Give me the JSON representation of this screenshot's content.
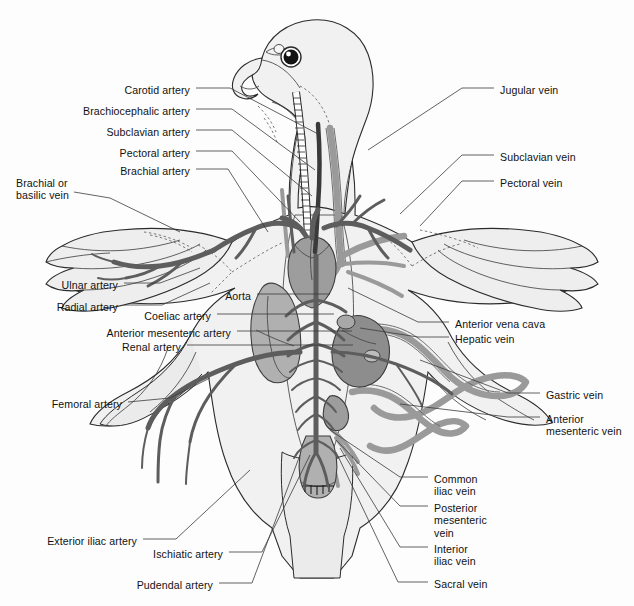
{
  "figure": {
    "colors": {
      "artery": "#5f5f5f",
      "vein": "#8f8f8f",
      "organ_fill": "#9a9a9a",
      "body_fill": "#f0f0f0",
      "outline": "#2b2b2b",
      "leader_line": "#3a3a3a",
      "text": "#111111",
      "background": "#fdfdfd"
    }
  },
  "labels_left": [
    {
      "id": "carotid-artery",
      "text": "Carotid artery",
      "x": 190,
      "y": 84,
      "align": "right"
    },
    {
      "id": "brachiocephalic-artery",
      "text": "Brachiocephalic artery",
      "x": 190,
      "y": 105,
      "align": "right"
    },
    {
      "id": "subclavian-artery",
      "text": "Subclavian artery",
      "x": 190,
      "y": 126,
      "align": "right"
    },
    {
      "id": "pectoral-artery",
      "text": "Pectoral artery",
      "x": 190,
      "y": 147,
      "align": "right"
    },
    {
      "id": "brachial-artery",
      "text": "Brachial artery",
      "x": 190,
      "y": 165,
      "align": "right"
    },
    {
      "id": "brachial-or-basilic-vein",
      "text": "Brachial or\nbasilic vein",
      "x": 16,
      "y": 177,
      "align": "left"
    },
    {
      "id": "ulnar-artery",
      "text": "Ulnar artery",
      "x": 118,
      "y": 279,
      "align": "right"
    },
    {
      "id": "radial-artery",
      "text": "Radial artery",
      "x": 118,
      "y": 301,
      "align": "right"
    },
    {
      "id": "aorta",
      "text": "Aorta",
      "x": 251,
      "y": 290,
      "align": "right"
    },
    {
      "id": "coeliac-artery",
      "text": "Coeliac artery",
      "x": 211,
      "y": 310,
      "align": "right"
    },
    {
      "id": "anterior-mesenteric-artery",
      "text": "Anterior mesenteric artery",
      "x": 231,
      "y": 327,
      "align": "right"
    },
    {
      "id": "renal-artery",
      "text": "Renal artery",
      "x": 181,
      "y": 341,
      "align": "right"
    },
    {
      "id": "femoral-artery",
      "text": "Femoral artery",
      "x": 122,
      "y": 398,
      "align": "right"
    },
    {
      "id": "exterior-iliac-artery",
      "text": "Exterior iliac artery",
      "x": 137,
      "y": 535,
      "align": "right"
    },
    {
      "id": "ischiatic-artery",
      "text": "Ischiatic artery",
      "x": 223,
      "y": 548,
      "align": "right"
    },
    {
      "id": "pudendal-artery",
      "text": "Pudendal artery",
      "x": 213,
      "y": 579,
      "align": "right"
    }
  ],
  "labels_right": [
    {
      "id": "jugular-vein",
      "text": "Jugular vein",
      "x": 500,
      "y": 84,
      "align": "left"
    },
    {
      "id": "subclavian-vein",
      "text": "Subclavian vein",
      "x": 500,
      "y": 151,
      "align": "left"
    },
    {
      "id": "pectoral-vein",
      "text": "Pectoral vein",
      "x": 500,
      "y": 177,
      "align": "left"
    },
    {
      "id": "anterior-vena-cava",
      "text": "Anterior vena cava",
      "x": 455,
      "y": 318,
      "align": "left"
    },
    {
      "id": "hepatic-vein",
      "text": "Hepatic vein",
      "x": 455,
      "y": 333,
      "align": "left"
    },
    {
      "id": "gastric-vein",
      "text": "Gastric vein",
      "x": 546,
      "y": 389,
      "align": "left"
    },
    {
      "id": "anterior-mesenteric-vein",
      "text": "Anterior\nmesenteric vein",
      "x": 546,
      "y": 413,
      "align": "left"
    },
    {
      "id": "common-iliac-vein",
      "text": "Common\niliac vein",
      "x": 434,
      "y": 473,
      "align": "left"
    },
    {
      "id": "posterior-mesenteric-vein",
      "text": "Posterior\nmesenteric\nvein",
      "x": 434,
      "y": 502,
      "align": "left"
    },
    {
      "id": "interior-iliac-vein",
      "text": "Interior\niliac vein",
      "x": 434,
      "y": 543,
      "align": "left"
    },
    {
      "id": "sacral-vein",
      "text": "Sacral vein",
      "x": 434,
      "y": 578,
      "align": "left"
    }
  ],
  "leaders_left": [
    {
      "id": "leader-carotid-artery",
      "points": "196,88 230,88 320,135"
    },
    {
      "id": "leader-brachiocephalic-artery",
      "points": "196,109 232,109 315,170"
    },
    {
      "id": "leader-subclavian-artery",
      "points": "196,130 232,130 312,196"
    },
    {
      "id": "leader-pectoral-artery",
      "points": "196,151 232,151 300,222"
    },
    {
      "id": "leader-brachial-artery",
      "points": "196,169 228,169 268,232"
    },
    {
      "id": "leader-brachial-or-basilic-vein",
      "points": "74,192 110,198 180,232"
    },
    {
      "id": "leader-ulnar-artery",
      "points": "124,283 160,283 200,268"
    },
    {
      "id": "leader-radial-artery",
      "points": "124,305 162,305 210,283"
    },
    {
      "id": "leader-aorta",
      "points": "257,294 300,294 330,294"
    },
    {
      "id": "leader-coeliac-artery",
      "points": "217,314 300,314 334,314"
    },
    {
      "id": "leader-anterior-mesenteric-artery",
      "points": "237,331 320,331 352,331"
    },
    {
      "id": "leader-renal-artery",
      "points": "187,345 300,345 353,345"
    },
    {
      "id": "leader-femoral-artery",
      "points": "128,402 170,398 210,378"
    },
    {
      "id": "leader-exterior-iliac-artery",
      "points": "143,539 176,539 250,470"
    },
    {
      "id": "leader-ischiatic-artery",
      "points": "229,552 262,552 310,455"
    },
    {
      "id": "leader-pudendal-artery",
      "points": "219,583 252,583 300,455"
    }
  ],
  "leaders_right": [
    {
      "id": "leader-jugular-vein",
      "points": "494,88 462,88 368,150"
    },
    {
      "id": "leader-subclavian-vein",
      "points": "494,155 462,155 400,214"
    },
    {
      "id": "leader-pectoral-vein",
      "points": "494,181 462,181 420,226"
    },
    {
      "id": "leader-anterior-vena-cava",
      "points": "449,322 418,322 348,288"
    },
    {
      "id": "leader-hepatic-vein",
      "points": "449,337 418,337 360,328"
    },
    {
      "id": "leader-gastric-vein",
      "points": "540,393 508,393 420,360"
    },
    {
      "id": "leader-anterior-mesenteric-vein",
      "points": "540,417 508,417 400,404"
    },
    {
      "id": "leader-common-iliac-vein",
      "points": "428,477 400,477 330,430"
    },
    {
      "id": "leader-posterior-mesenteric-vein",
      "points": "428,506 400,506 336,440"
    },
    {
      "id": "leader-interior-iliac-vein",
      "points": "428,547 400,547 340,448"
    },
    {
      "id": "leader-sacral-vein",
      "points": "428,582 398,582 336,452"
    }
  ]
}
